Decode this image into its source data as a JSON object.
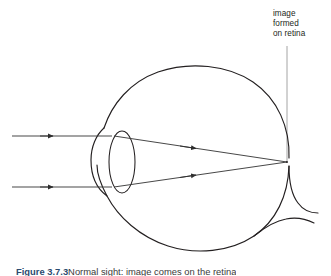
{
  "figure": {
    "title_caption_number": "Figure 3.7.3",
    "caption_text": "Normal sight: image comes on the retina",
    "caption_full": "Figure 3.7.3 Normal sight: image comes on the retina"
  },
  "labels": {
    "retina_label": {
      "line1": "image",
      "line2": "formed",
      "line3": "on retina"
    }
  },
  "colors": {
    "background": "#ffffff",
    "stroke": "#231f20",
    "ray": "#3d3d3d",
    "pointer_line": "#9a9a9a",
    "text": "#231f20",
    "caption_accent": "#2b4a6f"
  },
  "diagram": {
    "type": "optics-ray-diagram",
    "parts": [
      "eyeball-outline",
      "cornea",
      "lens",
      "optic-nerve",
      "incoming-ray-upper",
      "incoming-ray-lower",
      "refracted-ray-upper",
      "refracted-ray-lower",
      "focal-point",
      "retina-pointer-line"
    ],
    "focal_point": {
      "x": 287,
      "y": 162
    },
    "incoming_rays": [
      {
        "name": "upper",
        "y": 136,
        "x_start": 12,
        "x_end": 110,
        "arrow_x": 48
      },
      {
        "name": "lower",
        "y": 187,
        "x_start": 12,
        "x_end": 110,
        "arrow_x": 48
      }
    ],
    "refracted_rays": [
      {
        "name": "upper",
        "from_x": 116,
        "from_y": 136,
        "to_x": 287,
        "to_y": 162,
        "arrow_x": 193
      },
      {
        "name": "lower",
        "from_x": 116,
        "from_y": 187,
        "to_x": 287,
        "to_y": 162,
        "arrow_x": 193
      }
    ],
    "lens": {
      "cx": 122,
      "cy": 162,
      "rx": 13,
      "ry": 31
    },
    "pointer_line": {
      "x": 287,
      "y_top": 46,
      "y_bottom": 163
    }
  }
}
